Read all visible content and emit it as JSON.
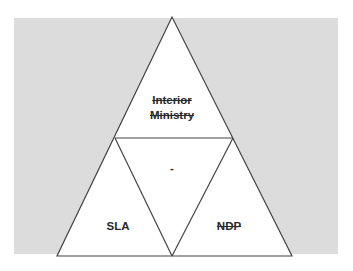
{
  "diagram": {
    "type": "triforce-triangle",
    "background_color": "#dcdcdc",
    "line_color": "#444444",
    "segments": {
      "top": {
        "label_line1": "Interior",
        "label_line2": "Ministry",
        "struck_through": true
      },
      "center": {
        "label": "-",
        "struck_through": false
      },
      "bottom_left": {
        "label": "SLA",
        "struck_through": false
      },
      "bottom_right": {
        "label": "NDP",
        "struck_through": true
      }
    }
  }
}
